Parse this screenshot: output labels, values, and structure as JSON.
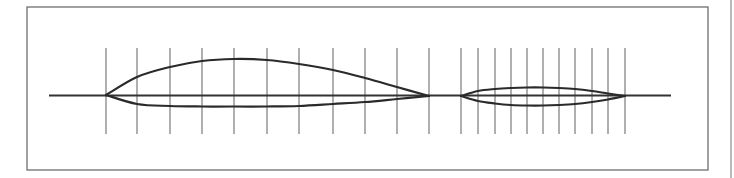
{
  "figure": {
    "colors": {
      "background": "#ffffff",
      "frame": "#6e6e6e",
      "station_line": "#7a7a7a",
      "profile": "#2a2a2a",
      "chord": "#333333",
      "edge_rule": "#8a8a8a"
    },
    "frame": {
      "x": 27,
      "y": 7,
      "width": 681,
      "height": 163
    },
    "edge_rule": {
      "x": 731,
      "y1": 0,
      "y2": 178
    },
    "baseline": {
      "x1": 49,
      "x2": 671,
      "y": 95.5
    },
    "station_lines": {
      "y1": 48,
      "y2": 134
    },
    "airfoils": [
      {
        "name": "large-airfoil",
        "leading_edge": [
          106,
          95
        ],
        "trailing_edge": [
          429,
          96
        ],
        "stations_x": [
          106,
          137,
          170,
          202,
          234,
          267,
          299,
          333,
          365,
          397,
          429
        ],
        "upper_surface": [
          [
            106,
            95
          ],
          [
            137,
            77
          ],
          [
            170,
            67
          ],
          [
            202,
            61
          ],
          [
            234,
            59
          ],
          [
            267,
            60
          ],
          [
            299,
            64
          ],
          [
            333,
            70
          ],
          [
            365,
            78
          ],
          [
            397,
            87
          ],
          [
            429,
            96
          ]
        ],
        "lower_surface": [
          [
            106,
            95
          ],
          [
            137,
            104
          ],
          [
            170,
            106
          ],
          [
            202,
            106.5
          ],
          [
            234,
            106.5
          ],
          [
            267,
            106.5
          ],
          [
            299,
            106
          ],
          [
            333,
            104
          ],
          [
            365,
            102
          ],
          [
            397,
            99
          ],
          [
            429,
            96
          ]
        ]
      },
      {
        "name": "small-airfoil",
        "leading_edge": [
          461,
          96
        ],
        "trailing_edge": [
          625,
          96
        ],
        "stations_x": [
          461,
          478,
          495,
          511,
          527,
          543,
          559,
          575,
          592,
          608,
          625
        ],
        "upper_surface": [
          [
            461,
            96
          ],
          [
            478,
            91
          ],
          [
            495,
            89
          ],
          [
            511,
            88
          ],
          [
            527,
            87.5
          ],
          [
            543,
            87.5
          ],
          [
            559,
            88
          ],
          [
            575,
            89
          ],
          [
            592,
            91
          ],
          [
            608,
            93.5
          ],
          [
            625,
            96
          ]
        ],
        "lower_surface": [
          [
            461,
            96
          ],
          [
            478,
            101
          ],
          [
            495,
            103.5
          ],
          [
            511,
            105
          ],
          [
            527,
            105.5
          ],
          [
            543,
            105.5
          ],
          [
            559,
            105
          ],
          [
            575,
            104
          ],
          [
            592,
            102
          ],
          [
            608,
            99.5
          ],
          [
            625,
            96
          ]
        ]
      }
    ]
  }
}
